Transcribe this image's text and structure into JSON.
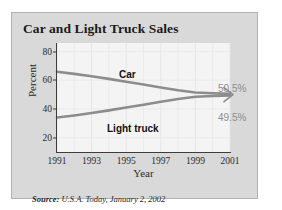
{
  "figure": {
    "title": "Car and Light Truck Sales",
    "source_note": "Source: U.S.A. Today, January 2, 2002",
    "source_prefix": "Source:",
    "source_rest": " U.S.A. Today, January 2, 2002",
    "card_background": "#d9d9d9",
    "plot_background": "#f4f4f4",
    "line_color": "#8c8c8c",
    "text_color": "#1a1a1a",
    "value_label_color": "#8c8c8c"
  },
  "chart_data": {
    "type": "line",
    "title": "Car and Light Truck Sales",
    "xlabel": "Year",
    "ylabel": "Percent",
    "xlim": [
      1991,
      2001
    ],
    "ylim": [
      10,
      86
    ],
    "grid": true,
    "legend_position": "inline-annotation",
    "x": [
      1991,
      1992,
      1993,
      1994,
      1995,
      1996,
      1997,
      1998,
      1999,
      2000,
      2001
    ],
    "xticks": [
      1991,
      1993,
      1995,
      1997,
      1999,
      2001
    ],
    "xtick_labels": [
      "1991",
      "1993",
      "1995",
      "1997",
      "1999",
      "2001"
    ],
    "yticks": [
      20,
      40,
      60,
      80
    ],
    "ytick_labels": [
      "20",
      "40",
      "60",
      "80"
    ],
    "series": [
      {
        "name": "Car",
        "label": "Car",
        "color": "#8c8c8c",
        "end_value_label": "50.5%",
        "values": [
          66.0,
          64.5,
          62.8,
          61.0,
          59.0,
          57.0,
          55.0,
          53.0,
          51.5,
          51.0,
          50.5
        ]
      },
      {
        "name": "Light truck",
        "label": "Light truck",
        "color": "#8c8c8c",
        "end_value_label": "49.5%",
        "values": [
          34.0,
          35.5,
          37.2,
          39.0,
          41.0,
          43.0,
          45.0,
          47.0,
          48.5,
          49.0,
          49.5
        ]
      }
    ],
    "annotations": [
      {
        "text": "Car",
        "x": 1995,
        "y": 61
      },
      {
        "text": "Light truck",
        "x": 1994.5,
        "y": 37
      },
      {
        "text": "50.5%",
        "x": 2001.6,
        "y": 55
      },
      {
        "text": "49.5%",
        "x": 2001.6,
        "y": 44
      }
    ]
  }
}
